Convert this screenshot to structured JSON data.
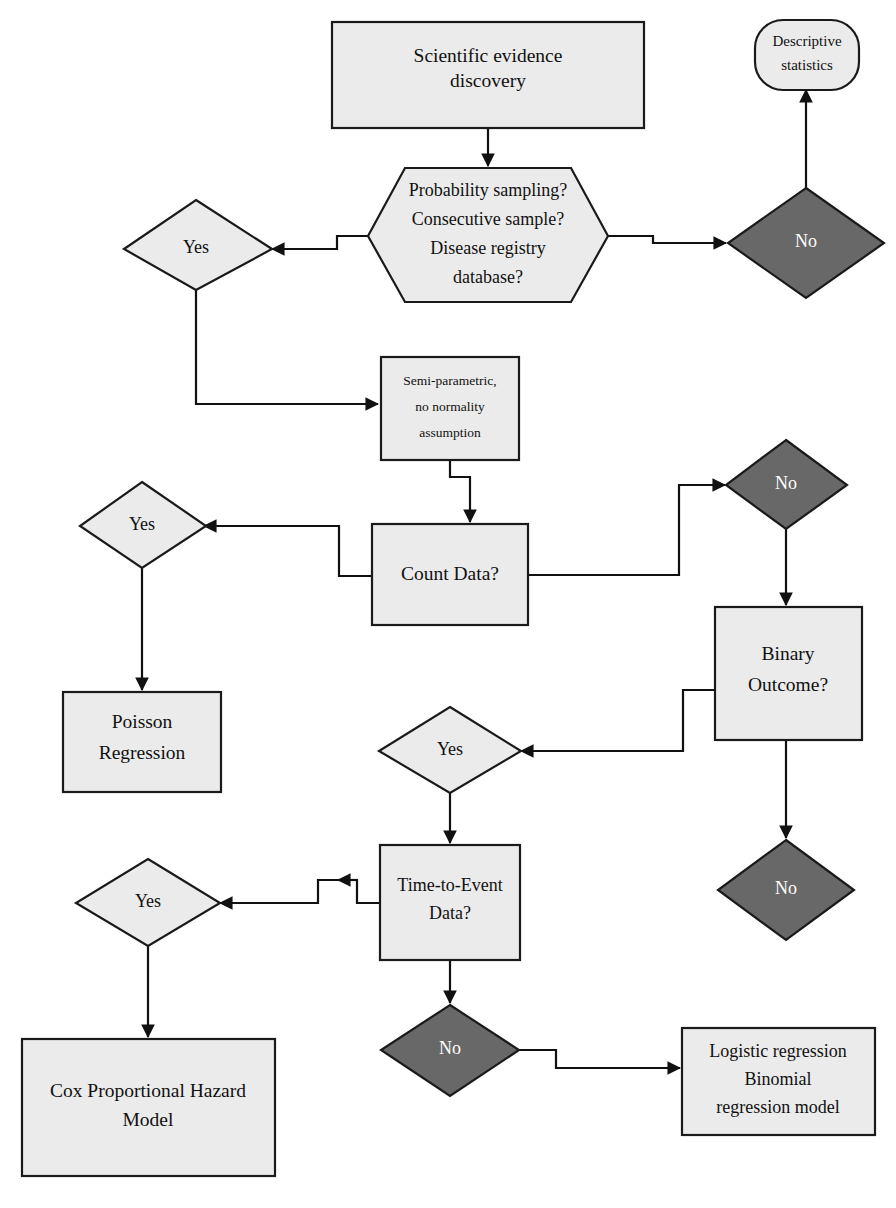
{
  "diagram": {
    "colors": {
      "node_fill_light": "#ebebeb",
      "node_fill_dark": "#686868",
      "stroke": "#1a1a1a",
      "text_on_light": "#111111",
      "text_on_dark": "#ffffff",
      "background": "#ffffff"
    },
    "nodes": [
      {
        "id": "scientific_evidence",
        "shape": "rectangle",
        "fill": "light",
        "lines": [
          "Scientific evidence",
          "discovery"
        ]
      },
      {
        "id": "descriptive_statistics",
        "shape": "stadium",
        "fill": "light",
        "lines": [
          "Descriptive",
          "statistics"
        ]
      },
      {
        "id": "sampling_question",
        "shape": "hexagon",
        "fill": "light",
        "lines": [
          "Probability sampling?",
          "Consecutive sample?",
          "Disease registry",
          "database?"
        ]
      },
      {
        "id": "yes_sampling",
        "shape": "diamond",
        "fill": "light",
        "lines": [
          "Yes"
        ]
      },
      {
        "id": "no_sampling",
        "shape": "diamond",
        "fill": "dark",
        "lines": [
          "No"
        ]
      },
      {
        "id": "semi_parametric",
        "shape": "rectangle",
        "fill": "light",
        "lines": [
          "Semi-parametric,",
          "no normality",
          "assumption"
        ]
      },
      {
        "id": "count_data",
        "shape": "rectangle",
        "fill": "light",
        "lines": [
          "Count Data?"
        ]
      },
      {
        "id": "yes_count",
        "shape": "diamond",
        "fill": "light",
        "lines": [
          "Yes"
        ]
      },
      {
        "id": "no_count",
        "shape": "diamond",
        "fill": "dark",
        "lines": [
          "No"
        ]
      },
      {
        "id": "poisson_regression",
        "shape": "rectangle",
        "fill": "light",
        "lines": [
          "Poisson",
          "Regression"
        ]
      },
      {
        "id": "binary_outcome",
        "shape": "rectangle",
        "fill": "light",
        "lines": [
          "Binary",
          "Outcome?"
        ]
      },
      {
        "id": "yes_binary",
        "shape": "diamond",
        "fill": "light",
        "lines": [
          "Yes"
        ]
      },
      {
        "id": "no_binary",
        "shape": "diamond",
        "fill": "dark",
        "lines": [
          "No"
        ]
      },
      {
        "id": "time_to_event",
        "shape": "rectangle",
        "fill": "light",
        "lines": [
          "Time-to-Event",
          "Data?"
        ]
      },
      {
        "id": "yes_time",
        "shape": "diamond",
        "fill": "light",
        "lines": [
          "Yes"
        ]
      },
      {
        "id": "no_time",
        "shape": "diamond",
        "fill": "dark",
        "lines": [
          "No"
        ]
      },
      {
        "id": "cox_model",
        "shape": "rectangle",
        "fill": "light",
        "lines": [
          "Cox Proportional Hazard",
          "Model"
        ]
      },
      {
        "id": "logistic_regression",
        "shape": "rectangle",
        "fill": "light",
        "lines": [
          "Logistic regression",
          "Binomial",
          "regression model"
        ]
      }
    ],
    "labels": {
      "scientific_evidence_1": "Scientific evidence",
      "scientific_evidence_2": "discovery",
      "descriptive_1": "Descriptive",
      "descriptive_2": "statistics",
      "sampling_1": "Probability sampling?",
      "sampling_2": "Consecutive sample?",
      "sampling_3": "Disease registry",
      "sampling_4": "database?",
      "yes": "Yes",
      "no": "No",
      "semi_1": "Semi-parametric,",
      "semi_2": "no normality",
      "semi_3": "assumption",
      "count_data": "Count Data?",
      "poisson_1": "Poisson",
      "poisson_2": "Regression",
      "binary_1": "Binary",
      "binary_2": "Outcome?",
      "time_1": "Time-to-Event",
      "time_2": "Data?",
      "cox_1": "Cox Proportional Hazard",
      "cox_2": "Model",
      "logistic_1": "Logistic regression",
      "logistic_2": "Binomial",
      "logistic_3": "regression model"
    },
    "edges": [
      {
        "id": "evidence-to-sampling",
        "from": "scientific_evidence",
        "to": "sampling_question",
        "arrow": true
      },
      {
        "id": "sampling-to-yes",
        "from": "sampling_question",
        "to": "yes_sampling",
        "arrow": true
      },
      {
        "id": "sampling-to-no",
        "from": "sampling_question",
        "to": "no_sampling",
        "arrow": true
      },
      {
        "id": "no-to-descriptive",
        "from": "no_sampling",
        "to": "descriptive_statistics",
        "arrow": true
      },
      {
        "id": "yes-to-semiparametric",
        "from": "yes_sampling",
        "to": "semi_parametric",
        "arrow": true
      },
      {
        "id": "semiparametric-to-count",
        "from": "semi_parametric",
        "to": "count_data",
        "arrow": true
      },
      {
        "id": "count-to-yes",
        "from": "count_data",
        "to": "yes_count",
        "arrow": true
      },
      {
        "id": "count-to-no",
        "from": "count_data",
        "to": "no_count",
        "arrow": true
      },
      {
        "id": "yes-to-poisson",
        "from": "yes_count",
        "to": "poisson_regression",
        "arrow": true
      },
      {
        "id": "no-to-binary",
        "from": "no_count",
        "to": "binary_outcome",
        "arrow": true
      },
      {
        "id": "binary-to-yes",
        "from": "binary_outcome",
        "to": "yes_binary",
        "arrow": true
      },
      {
        "id": "binary-to-no",
        "from": "binary_outcome",
        "to": "no_binary",
        "arrow": true
      },
      {
        "id": "yes-to-time",
        "from": "yes_binary",
        "to": "time_to_event",
        "arrow": true
      },
      {
        "id": "time-to-yes",
        "from": "time_to_event",
        "to": "yes_time",
        "arrow": true
      },
      {
        "id": "time-to-no",
        "from": "time_to_event",
        "to": "no_time",
        "arrow": true
      },
      {
        "id": "yes-to-cox",
        "from": "yes_time",
        "to": "cox_model",
        "arrow": true
      },
      {
        "id": "no-to-logistic",
        "from": "no_time",
        "to": "logistic_regression",
        "arrow": true
      }
    ]
  }
}
